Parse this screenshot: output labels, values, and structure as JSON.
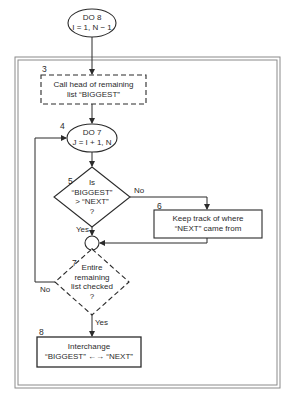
{
  "diagram": {
    "type": "flowchart",
    "nodes": {
      "do8": {
        "shape": "oval",
        "lines": [
          "DO 8",
          "I = 1, N − 1"
        ]
      },
      "step3": {
        "number": "3",
        "shape": "dashed-rectangle",
        "lines": [
          "Call head of remaining",
          "list “BIGGEST”"
        ]
      },
      "step4": {
        "number": "4",
        "shape": "oval",
        "lines": [
          "DO 7",
          "J = I + 1, N"
        ]
      },
      "step5": {
        "number": "5",
        "shape": "diamond",
        "lines": [
          "Is",
          "“BIGGEST”",
          "> “NEXT”",
          "?"
        ]
      },
      "step6": {
        "number": "6",
        "shape": "rectangle",
        "lines": [
          "Keep track of where",
          "“NEXT” came from"
        ]
      },
      "junction": {
        "shape": "circle"
      },
      "step7": {
        "number": "7",
        "shape": "dashed-diamond",
        "lines": [
          "Entire",
          "remaining",
          "list checked",
          "?"
        ]
      },
      "step8": {
        "number": "8",
        "shape": "rectangle",
        "lines": [
          "Interchange",
          "“BIGGEST” ←→ “NEXT”"
        ]
      }
    },
    "edges": {
      "step5_no": "No",
      "step5_yes": "Yes",
      "step7_no": "No",
      "step7_yes": "Yes"
    },
    "caption": ""
  },
  "colors": {
    "ink": "#2b2b2b",
    "frame": "#8a8a8a",
    "background": "#ffffff"
  }
}
